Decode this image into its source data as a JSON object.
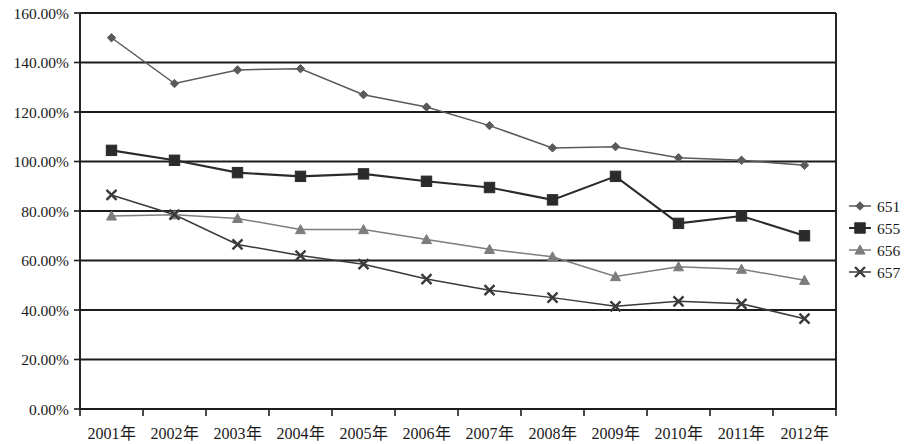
{
  "chart_data": {
    "type": "line",
    "title": "",
    "subtitle": "",
    "xlabel": "",
    "ylabel": "",
    "ylim": [
      0,
      160
    ],
    "ytick_step": 20,
    "ytick_labels": [
      "0.00%",
      "20.00%",
      "40.00%",
      "60.00%",
      "80.00%",
      "100.00%",
      "120.00%",
      "140.00%",
      "160.00%"
    ],
    "ytick_values": [
      0,
      20,
      40,
      60,
      80,
      100,
      120,
      140,
      160
    ],
    "grid": true,
    "grid_axis": "y",
    "legend_position": "right",
    "categories": [
      "2001年",
      "2002年",
      "2003年",
      "2004年",
      "2005年",
      "2006年",
      "2007年",
      "2008年",
      "2009年",
      "2010年",
      "2011年",
      "2012年"
    ],
    "series": [
      {
        "name": "651",
        "marker": "diamond",
        "color": "#5a5a5a",
        "values": [
          150.0,
          131.5,
          137.0,
          137.5,
          127.0,
          122.0,
          114.5,
          105.5,
          106.0,
          101.5,
          100.5,
          98.5
        ]
      },
      {
        "name": "655",
        "marker": "square",
        "color": "#2b2b2b",
        "values": [
          104.5,
          100.5,
          95.5,
          94.0,
          95.0,
          92.0,
          89.5,
          84.5,
          94.0,
          75.0,
          78.0,
          70.0
        ]
      },
      {
        "name": "656",
        "marker": "triangle",
        "color": "#7d7d7d",
        "values": [
          78.0,
          78.5,
          77.0,
          72.5,
          72.5,
          68.5,
          64.5,
          61.5,
          53.5,
          57.5,
          56.5,
          52.0
        ]
      },
      {
        "name": "657",
        "marker": "cross",
        "color": "#3a3a3a",
        "values": [
          86.5,
          78.5,
          66.5,
          62.0,
          58.5,
          52.5,
          48.0,
          45.0,
          41.5,
          43.5,
          42.5,
          36.5
        ]
      }
    ]
  },
  "legend": {
    "items": [
      {
        "label": "651"
      },
      {
        "label": "655"
      },
      {
        "label": "656"
      },
      {
        "label": "657"
      }
    ]
  }
}
